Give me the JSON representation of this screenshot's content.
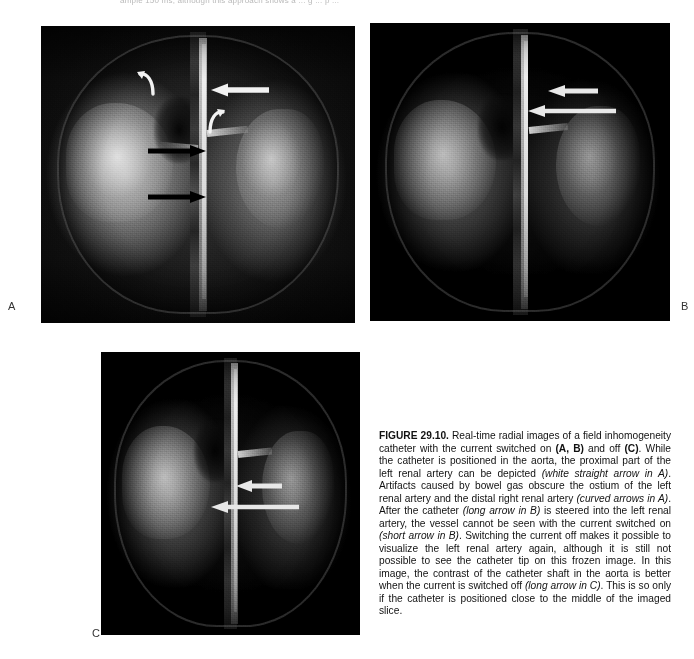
{
  "page": {
    "top_cut_text": "ample 150 ms, although this approach shows a ... g ... p ...",
    "figure_number": "FIGURE 29.10.",
    "caption_text": "Real-time radial images of a field inhomogeneity catheter with the current switched on (A, B) and off (C). While the catheter is positioned in the aorta, the proximal part of the left renal artery can be depicted (white straight arrow in A). Artifacts caused by bowel gas obscure the ostium of the left renal artery and the distal right renal artery (curved arrows in A). After the catheter (long arrow in B) is steered into the left renal artery, the vessel cannot be seen with the current switched on (short arrow in B). Switching the current off makes it possible to visualize the left renal artery again, although it is still not possible to see the catheter tip on this frozen image. In this image, the contrast of the catheter shaft in the aorta is better when the current is switched off (long arrow in C). This is so only if the catheter is positioned close to the middle of the imaged slice."
  },
  "caption_runs": [
    {
      "text": "FIGURE 29.10.",
      "style": "bold"
    },
    {
      "text": "  Real-time radial images of a field inhomogeneity catheter with the current switched on ",
      "style": "normal"
    },
    {
      "text": "(A, B)",
      "style": "bold"
    },
    {
      "text": " and off ",
      "style": "normal"
    },
    {
      "text": "(C)",
      "style": "bold"
    },
    {
      "text": ". While the catheter is positioned in the aorta, the proximal part of the left renal artery can be depicted ",
      "style": "normal"
    },
    {
      "text": "(white straight arrow in A)",
      "style": "italic"
    },
    {
      "text": ". Artifacts caused by bowel gas obscure the ostium of the left renal artery and the distal right renal artery ",
      "style": "normal"
    },
    {
      "text": "(curved arrows in A)",
      "style": "italic"
    },
    {
      "text": ". After the catheter ",
      "style": "normal"
    },
    {
      "text": "(long arrow in B)",
      "style": "italic"
    },
    {
      "text": " is steered into the left renal artery, the vessel cannot be seen with the current switched on ",
      "style": "normal"
    },
    {
      "text": "(short arrow in B)",
      "style": "italic"
    },
    {
      "text": ". Switching the current off makes it possible to visualize the left renal artery again, although it is still not possible to see the catheter tip on this frozen image. In this image, the contrast of the catheter shaft in the aorta is better when the current is switched off ",
      "style": "normal"
    },
    {
      "text": "(long arrow in C)",
      "style": "italic"
    },
    {
      "text": ". This is so only if the catheter is positioned close to the middle of the imaged slice.",
      "style": "normal"
    }
  ],
  "panels": [
    {
      "id": "A",
      "label": "A",
      "modality": "MRI coronal real-time radial image",
      "condition": "current switched on",
      "annotations": [
        {
          "name": "black-straight-arrow-upper",
          "kind": "straight",
          "color": "#000000",
          "direction": "right"
        },
        {
          "name": "black-straight-arrow-lower",
          "kind": "straight",
          "color": "#000000",
          "direction": "right"
        },
        {
          "name": "white-straight-arrow",
          "kind": "straight",
          "color": "#f2f2f2",
          "direction": "left"
        },
        {
          "name": "white-curved-arrow-left",
          "kind": "curved",
          "color": "#f2f2f2"
        },
        {
          "name": "white-curved-arrow-right",
          "kind": "curved",
          "color": "#f2f2f2"
        }
      ]
    },
    {
      "id": "B",
      "label": "B",
      "modality": "MRI coronal real-time radial image",
      "condition": "current switched on",
      "annotations": [
        {
          "name": "white-short-arrow",
          "kind": "straight",
          "color": "#e8e8e8",
          "direction": "left"
        },
        {
          "name": "white-long-arrow",
          "kind": "straight",
          "color": "#e8e8e8",
          "direction": "left"
        }
      ]
    },
    {
      "id": "C",
      "label": "C",
      "modality": "MRI coronal real-time radial image",
      "condition": "current switched off",
      "annotations": [
        {
          "name": "white-short-arrow",
          "kind": "straight",
          "color": "#e8e8e8",
          "direction": "left"
        },
        {
          "name": "white-long-arrow",
          "kind": "straight",
          "color": "#e8e8e8",
          "direction": "left"
        }
      ]
    }
  ],
  "colors": {
    "page_background": "#ffffff",
    "image_background": "#0a0a0a",
    "caption_text": "#111111",
    "label_text": "#333333",
    "white_arrow": "#f0f0f0",
    "black_arrow": "#000000"
  }
}
